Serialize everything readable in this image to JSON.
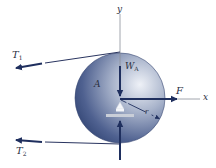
{
  "diagram": {
    "type": "free-body-diagram",
    "colors": {
      "arrow": "#1f2f5e",
      "disk_dark": "#2c3f6e",
      "disk_light": "#e6eaf3",
      "axis": "#8a8f99",
      "label": "#2a2f3f",
      "support": "#c9ced8"
    },
    "axes": {
      "x_label": "x",
      "y_label": "y"
    },
    "body_label": "A",
    "forces": [
      {
        "id": "T1",
        "label": "T",
        "subscript": "1",
        "direction": "left, slightly downward"
      },
      {
        "id": "T2",
        "label": "T",
        "subscript": "2",
        "direction": "left"
      },
      {
        "id": "WA",
        "label": "W",
        "subscript": "A",
        "direction": "down"
      },
      {
        "id": "F",
        "label": "F",
        "subscript": "",
        "direction": "right"
      },
      {
        "id": "R",
        "label": "",
        "subscript": "",
        "direction": "up"
      }
    ],
    "radius_label": "r"
  }
}
